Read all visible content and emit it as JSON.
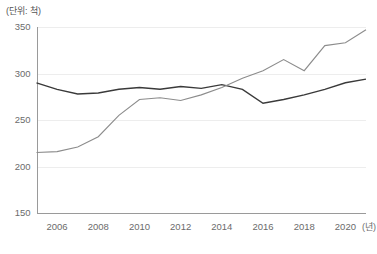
{
  "chart_data": {
    "type": "line",
    "title": "",
    "subtitle": "",
    "unit_label": "(단위: 척)",
    "xlabel": "(년)",
    "ylabel": "",
    "x": [
      2005,
      2006,
      2007,
      2008,
      2009,
      2010,
      2011,
      2012,
      2013,
      2014,
      2015,
      2016,
      2017,
      2018,
      2019,
      2020,
      2021
    ],
    "x_tick_labels": [
      "2006",
      "2008",
      "2010",
      "2012",
      "2014",
      "2016",
      "2018",
      "2020"
    ],
    "x_tick_values": [
      2006,
      2008,
      2010,
      2012,
      2014,
      2016,
      2018,
      2020
    ],
    "y_tick_labels": [
      "150",
      "200",
      "250",
      "300",
      "350"
    ],
    "y_tick_values": [
      150,
      200,
      250,
      300,
      350
    ],
    "xlim": [
      2005,
      2021
    ],
    "ylim": [
      150,
      350
    ],
    "grid": true,
    "grid_axis": "y",
    "legend": false,
    "legend_position": "none",
    "series": [
      {
        "name": "series-dark",
        "color": "#3a3a3a",
        "line_width": 1.4,
        "values": [
          290,
          283,
          278,
          279,
          283,
          285,
          283,
          286,
          284,
          288,
          283,
          268,
          272,
          277,
          283,
          290,
          294
        ]
      },
      {
        "name": "series-light",
        "color": "#8c8c8c",
        "line_width": 1.1,
        "values": [
          215,
          216,
          221,
          232,
          255,
          272,
          274,
          271,
          277,
          285,
          295,
          303,
          315,
          303,
          330,
          333,
          347
        ]
      }
    ],
    "annotations": []
  },
  "source_note": ""
}
